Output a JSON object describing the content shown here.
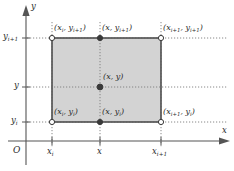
{
  "figure": {
    "type": "coordinate-diagram",
    "colors": {
      "rect_fill": "#d3d3d3",
      "rect_stroke": "#4d4d4d",
      "axis": "#555555",
      "dotted_guide": "#7a7a7a",
      "node_open_fill": "#ffffff",
      "node_filled": "#3a3a3a",
      "text": "#2b2b2b"
    },
    "axes": {
      "origin_label": "O",
      "x_axis_label": "x",
      "y_axis_label": "y"
    },
    "x_ticks": [
      {
        "id": "xi",
        "base": "x",
        "sub": "i",
        "label": "x_i"
      },
      {
        "id": "x",
        "base": "x",
        "sub": "",
        "label": "x"
      },
      {
        "id": "xip1",
        "base": "x",
        "sub": "i+1",
        "label": "x_i+1"
      }
    ],
    "y_ticks": [
      {
        "id": "yip1",
        "base": "y",
        "sub": "i+1",
        "label": "y_i+1"
      },
      {
        "id": "y",
        "base": "y",
        "sub": "",
        "label": "y"
      },
      {
        "id": "yi",
        "base": "y",
        "sub": "i",
        "label": "y_i"
      }
    ],
    "points": [
      {
        "id": "top-left",
        "marker": "open-circle",
        "x_base": "x",
        "x_sub": "i",
        "y_base": "y",
        "y_sub": "i+1",
        "label": "(x_i, y_i+1)"
      },
      {
        "id": "top-mid",
        "marker": "filled-circle",
        "x_base": "x",
        "x_sub": "",
        "y_base": "y",
        "y_sub": "i+1",
        "label": "(x, y_i+1)"
      },
      {
        "id": "top-right",
        "marker": "open-circle",
        "x_base": "x",
        "x_sub": "i+1",
        "y_base": "y",
        "y_sub": "i+1",
        "label": "(x_i+1, y_i+1)"
      },
      {
        "id": "center",
        "marker": "filled-circle",
        "x_base": "x",
        "x_sub": "",
        "y_base": "y",
        "y_sub": "",
        "label": "(x, y)"
      },
      {
        "id": "bottom-left",
        "marker": "open-circle",
        "x_base": "x",
        "x_sub": "i",
        "y_base": "y",
        "y_sub": "i",
        "label": "(x_i, y_i)"
      },
      {
        "id": "bottom-mid",
        "marker": "filled-circle",
        "x_base": "x",
        "x_sub": "",
        "y_base": "y",
        "y_sub": "i",
        "label": "(x, y_i)"
      },
      {
        "id": "bottom-right",
        "marker": "open-circle",
        "x_base": "x",
        "x_sub": "i+1",
        "y_base": "y",
        "y_sub": "i",
        "label": "(x_i+1, y_i)"
      }
    ]
  }
}
